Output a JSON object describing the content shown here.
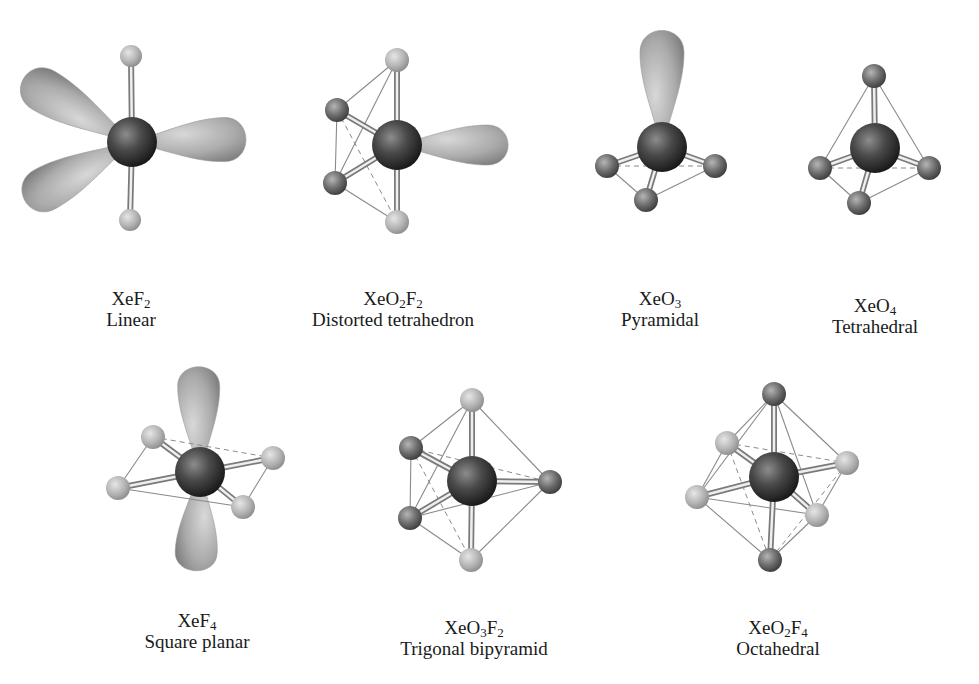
{
  "figure": {
    "colors": {
      "background": "#ffffff",
      "xenon": "#3a3a3a",
      "oxygen": "#6e6e6e",
      "fluorine": "#b8b8b8",
      "lone_pair": "#a9a9a9",
      "edge_line": "#8a8a8a",
      "text": "#1a1a1a"
    }
  },
  "molecules": [
    {
      "id": "xef2",
      "formula_parts": [
        [
          "Xe",
          ""
        ],
        [
          "F",
          "2"
        ]
      ],
      "formula": "XeF2",
      "geometry": "Linear",
      "label_pos": [
        131,
        288
      ],
      "center": [
        132,
        142
      ],
      "center_r": 25,
      "atoms": [
        {
          "type": "fluorine",
          "x": 131,
          "y": 56,
          "r": 11
        },
        {
          "type": "fluorine",
          "x": 130,
          "y": 220,
          "r": 11
        }
      ],
      "lone_pairs": [
        {
          "x": 60,
          "y": 100,
          "rx": 50,
          "ry": 22,
          "angle": 25
        },
        {
          "x": 208,
          "y": 140,
          "rx": 45,
          "ry": 22,
          "angle": 0
        },
        {
          "x": 62,
          "y": 180,
          "rx": 50,
          "ry": 22,
          "angle": -25
        }
      ],
      "edges": [],
      "dashed": []
    },
    {
      "id": "xeo2f2",
      "formula_parts": [
        [
          "Xe",
          ""
        ],
        [
          "O",
          "2"
        ],
        [
          "F",
          "2"
        ]
      ],
      "formula": "XeO2F2",
      "geometry": "Distorted tetrahedron",
      "label_pos": [
        393,
        288
      ],
      "center": [
        397,
        145
      ],
      "center_r": 25,
      "atoms": [
        {
          "type": "fluorine",
          "x": 397,
          "y": 60,
          "r": 12
        },
        {
          "type": "oxygen",
          "x": 337,
          "y": 110,
          "r": 12
        },
        {
          "type": "oxygen",
          "x": 335,
          "y": 183,
          "r": 12
        },
        {
          "type": "fluorine",
          "x": 397,
          "y": 222,
          "r": 12
        }
      ],
      "lone_pairs": [
        {
          "x": 470,
          "y": 145,
          "rx": 45,
          "ry": 20,
          "angle": 0
        }
      ],
      "edges": [
        [
          0,
          1
        ],
        [
          1,
          2
        ],
        [
          2,
          3
        ],
        [
          0,
          2
        ]
      ],
      "dashed": [
        [
          1,
          3
        ]
      ]
    },
    {
      "id": "xeo3",
      "formula_parts": [
        [
          "Xe",
          ""
        ],
        [
          "O",
          "3"
        ]
      ],
      "formula": "XeO3",
      "geometry": "Pyramidal",
      "label_pos": [
        660,
        288
      ],
      "center": [
        662,
        147
      ],
      "center_r": 25,
      "atoms": [
        {
          "type": "oxygen",
          "x": 607,
          "y": 166,
          "r": 12
        },
        {
          "type": "oxygen",
          "x": 715,
          "y": 166,
          "r": 12
        },
        {
          "type": "oxygen",
          "x": 646,
          "y": 200,
          "r": 12
        }
      ],
      "lone_pairs": [
        {
          "x": 662,
          "y": 75,
          "rx": 22,
          "ry": 52,
          "angle": 0
        }
      ],
      "edges": [
        [
          0,
          2
        ],
        [
          1,
          2
        ]
      ],
      "dashed": [
        [
          0,
          1
        ]
      ]
    },
    {
      "id": "xeo4",
      "formula_parts": [
        [
          "Xe",
          ""
        ],
        [
          "O",
          "4"
        ]
      ],
      "formula": "XeO4",
      "geometry": "Tetrahedral",
      "label_pos": [
        875,
        295
      ],
      "center": [
        875,
        148
      ],
      "center_r": 25,
      "atoms": [
        {
          "type": "oxygen",
          "x": 874,
          "y": 76,
          "r": 12
        },
        {
          "type": "oxygen",
          "x": 820,
          "y": 168,
          "r": 12
        },
        {
          "type": "oxygen",
          "x": 929,
          "y": 168,
          "r": 12
        },
        {
          "type": "oxygen",
          "x": 859,
          "y": 203,
          "r": 12
        }
      ],
      "lone_pairs": [],
      "edges": [
        [
          0,
          1
        ],
        [
          0,
          2
        ],
        [
          1,
          3
        ],
        [
          2,
          3
        ]
      ],
      "dashed": [
        [
          1,
          2
        ]
      ]
    },
    {
      "id": "xef4",
      "formula_parts": [
        [
          "Xe",
          ""
        ],
        [
          "F",
          "4"
        ]
      ],
      "formula": "XeF4",
      "geometry": "Square planar",
      "label_pos": [
        197,
        610
      ],
      "center": [
        200,
        472
      ],
      "center_r": 25,
      "atoms": [
        {
          "type": "fluorine",
          "x": 153,
          "y": 437,
          "r": 12
        },
        {
          "type": "fluorine",
          "x": 273,
          "y": 458,
          "r": 12
        },
        {
          "type": "fluorine",
          "x": 118,
          "y": 488,
          "r": 12
        },
        {
          "type": "fluorine",
          "x": 243,
          "y": 507,
          "r": 12
        }
      ],
      "lone_pairs": [
        {
          "x": 199,
          "y": 408,
          "rx": 21,
          "ry": 48,
          "angle": 0
        },
        {
          "x": 197,
          "y": 535,
          "rx": 21,
          "ry": 42,
          "angle": 0
        }
      ],
      "edges": [
        [
          0,
          2
        ],
        [
          2,
          3
        ],
        [
          1,
          3
        ]
      ],
      "dashed": [
        [
          0,
          1
        ]
      ]
    },
    {
      "id": "xeo3f2",
      "formula_parts": [
        [
          "Xe",
          ""
        ],
        [
          "O",
          "3"
        ],
        [
          "F",
          "2"
        ]
      ],
      "formula": "XeO3F2",
      "geometry": "Trigonal bipyramid",
      "label_pos": [
        474,
        617
      ],
      "center": [
        472,
        481
      ],
      "center_r": 25,
      "atoms": [
        {
          "type": "fluorine",
          "x": 472,
          "y": 400,
          "r": 12
        },
        {
          "type": "oxygen",
          "x": 411,
          "y": 448,
          "r": 12
        },
        {
          "type": "oxygen",
          "x": 550,
          "y": 482,
          "r": 12
        },
        {
          "type": "oxygen",
          "x": 410,
          "y": 518,
          "r": 12
        },
        {
          "type": "fluorine",
          "x": 471,
          "y": 560,
          "r": 12
        }
      ],
      "lone_pairs": [],
      "edges": [
        [
          0,
          1
        ],
        [
          0,
          2
        ],
        [
          0,
          3
        ],
        [
          1,
          3
        ],
        [
          3,
          2
        ],
        [
          3,
          4
        ],
        [
          2,
          4
        ]
      ],
      "dashed": [
        [
          1,
          2
        ],
        [
          1,
          4
        ]
      ]
    },
    {
      "id": "xeo2f4",
      "formula_parts": [
        [
          "Xe",
          ""
        ],
        [
          "O",
          "2"
        ],
        [
          "F",
          "4"
        ]
      ],
      "formula": "XeO2F4",
      "geometry": "Octahedral",
      "label_pos": [
        778,
        617
      ],
      "center": [
        774,
        477
      ],
      "center_r": 25,
      "atoms": [
        {
          "type": "oxygen",
          "x": 774,
          "y": 394,
          "r": 12
        },
        {
          "type": "fluorine",
          "x": 727,
          "y": 443,
          "r": 12
        },
        {
          "type": "fluorine",
          "x": 847,
          "y": 463,
          "r": 12
        },
        {
          "type": "fluorine",
          "x": 697,
          "y": 497,
          "r": 12
        },
        {
          "type": "fluorine",
          "x": 817,
          "y": 515,
          "r": 12
        },
        {
          "type": "oxygen",
          "x": 770,
          "y": 560,
          "r": 12
        }
      ],
      "lone_pairs": [],
      "edges": [
        [
          0,
          1
        ],
        [
          0,
          2
        ],
        [
          0,
          3
        ],
        [
          0,
          4
        ],
        [
          3,
          4
        ],
        [
          3,
          5
        ],
        [
          5,
          4
        ],
        [
          2,
          4
        ],
        [
          1,
          3
        ]
      ],
      "dashed": [
        [
          1,
          2
        ],
        [
          1,
          5
        ],
        [
          2,
          5
        ]
      ]
    }
  ]
}
